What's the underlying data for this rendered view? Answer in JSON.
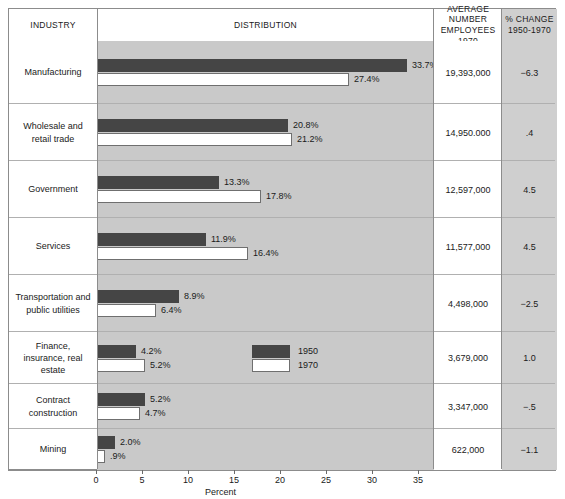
{
  "header": {
    "industry": "INDUSTRY",
    "distribution": "DISTRIBUTION",
    "employees_line1": "AVERAGE NUMBER",
    "employees_line2": "EMPLOYEES",
    "employees_line3": "1970",
    "change_line1": "% CHANGE",
    "change_line2": "1950-1970"
  },
  "legend": {
    "series_1950": "1950",
    "series_1970": "1970"
  },
  "axis": {
    "title": "Percent",
    "ticks": [
      "0",
      "5",
      "10",
      "15",
      "20",
      "25",
      "30",
      "35"
    ]
  },
  "colors": {
    "bar_1950": "#454545",
    "bar_1970": "#ffffff",
    "plot_band": "#c9c9c9",
    "change_column": "#cfcfcf",
    "border": "#8c8c8c"
  },
  "rows": [
    {
      "industry": "Manufacturing",
      "v1950": 33.7,
      "v1970": 27.4,
      "l1950": "33.7%",
      "l1970": "27.4%",
      "employees": "19,393,000",
      "change": "−6.3"
    },
    {
      "industry": "Wholesale and retail trade",
      "v1950": 20.8,
      "v1970": 21.2,
      "l1950": "20.8%",
      "l1970": "21.2%",
      "employees": "14,950.000",
      "change": ".4"
    },
    {
      "industry": "Government",
      "v1950": 13.3,
      "v1970": 17.8,
      "l1950": "13.3%",
      "l1970": "17.8%",
      "employees": "12,597,000",
      "change": "4.5"
    },
    {
      "industry": "Services",
      "v1950": 11.9,
      "v1970": 16.4,
      "l1950": "11.9%",
      "l1970": "16.4%",
      "employees": "11,577,000",
      "change": "4.5"
    },
    {
      "industry": "Transportation and public utilities",
      "v1950": 8.9,
      "v1970": 6.4,
      "l1950": "8.9%",
      "l1970": "6.4%",
      "employees": "4,498,000",
      "change": "−2.5"
    },
    {
      "industry": "Finance, insurance, real estate",
      "v1950": 4.2,
      "v1970": 5.2,
      "l1950": "4.2%",
      "l1970": "5.2%",
      "employees": "3,679,000",
      "change": "1.0"
    },
    {
      "industry": "Contract construction",
      "v1950": 5.2,
      "v1970": 4.7,
      "l1950": "5.2%",
      "l1970": "4.7%",
      "employees": "3,347,000",
      "change": "−.5"
    },
    {
      "industry": "Mining",
      "v1950": 2.0,
      "v1970": 0.9,
      "l1950": "2.0%",
      "l1970": ".9%",
      "employees": "622,000",
      "change": "−1.1"
    }
  ],
  "chart_data": {
    "type": "bar",
    "xlabel": "Percent",
    "ylabel": "",
    "xlim": [
      0,
      35
    ],
    "grid": false,
    "orientation": "horizontal",
    "legend_position": "inside-row-finance",
    "categories": [
      "Manufacturing",
      "Wholesale and retail trade",
      "Government",
      "Services",
      "Transportation and public utilities",
      "Finance, insurance, real estate",
      "Contract construction",
      "Mining"
    ],
    "series": [
      {
        "name": "1950",
        "values": [
          33.7,
          20.8,
          13.3,
          11.9,
          8.9,
          4.2,
          5.2,
          2.0
        ]
      },
      {
        "name": "1970",
        "values": [
          27.4,
          21.2,
          17.8,
          16.4,
          6.4,
          5.2,
          4.7,
          0.9
        ]
      }
    ],
    "table_columns": [
      "INDUSTRY",
      "DISTRIBUTION",
      "AVERAGE NUMBER EMPLOYEES 1970",
      "% CHANGE 1950-1970"
    ],
    "average_number_employees_1970": [
      "19,393,000",
      "14,950.000",
      "12,597,000",
      "11,577,000",
      "4,498,000",
      "3,679,000",
      "3,347,000",
      "622,000"
    ],
    "percent_change_1950_1970": [
      -6.3,
      0.4,
      4.5,
      4.5,
      -2.5,
      1.0,
      -0.5,
      -1.1
    ],
    "tick_labels": [
      "0",
      "5",
      "10",
      "15",
      "20",
      "25",
      "30",
      "35"
    ]
  }
}
